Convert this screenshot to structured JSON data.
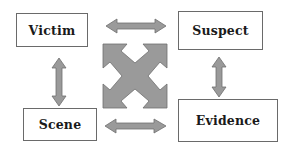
{
  "diagram": {
    "type": "relationship-diagram",
    "nodes": [
      {
        "id": "victim",
        "label": "Victim"
      },
      {
        "id": "suspect",
        "label": "Suspect"
      },
      {
        "id": "scene",
        "label": "Scene"
      },
      {
        "id": "evidence",
        "label": "Evidence"
      }
    ],
    "edges": [
      {
        "from": "victim",
        "to": "suspect",
        "style": "double-arrow"
      },
      {
        "from": "victim",
        "to": "scene",
        "style": "double-arrow"
      },
      {
        "from": "suspect",
        "to": "evidence",
        "style": "double-arrow"
      },
      {
        "from": "scene",
        "to": "evidence",
        "style": "double-arrow"
      },
      {
        "from": "victim",
        "to": "evidence",
        "style": "diagonal-4way-arrow"
      },
      {
        "from": "suspect",
        "to": "scene",
        "style": "diagonal-4way-arrow"
      }
    ],
    "colors": {
      "arrow_fill": "#9a9a9a",
      "arrow_stroke": "#6e6e6e",
      "box_border": "#6a6a6a",
      "text": "#1a1a1a",
      "background": "#ffffff"
    }
  }
}
